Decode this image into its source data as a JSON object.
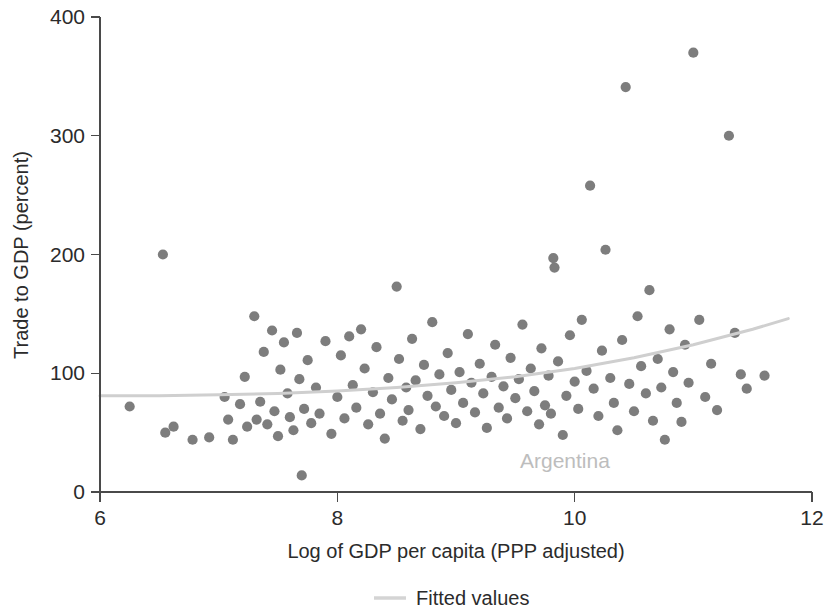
{
  "chart_data": {
    "type": "scatter",
    "title": "",
    "xlabel": "Log of GDP per capita (PPP adjusted)",
    "ylabel": "Trade to GDP (percent)",
    "xlim": [
      6,
      12
    ],
    "ylim": [
      0,
      400
    ],
    "xticks": [
      6,
      8,
      10,
      12
    ],
    "yticks": [
      0,
      100,
      200,
      300,
      400
    ],
    "xtick_labels": [
      "6",
      "8",
      "10",
      "12"
    ],
    "ytick_labels": [
      "0",
      "100",
      "200",
      "300",
      "400"
    ],
    "grid": false,
    "marker_color": "#7d7d7d",
    "fit_color": "#cfcfcf",
    "annotation_color": "#bdbdbd",
    "legend": {
      "position": "below-axis-center",
      "entries": [
        {
          "label": "Fitted values",
          "type": "line",
          "color": "#d4d4d4"
        }
      ]
    },
    "annotations": [
      {
        "text": "Argentina",
        "x": 9.55,
        "y": 28
      }
    ],
    "series": [
      {
        "name": "Countries",
        "type": "scatter",
        "marker": "filled-circle",
        "points": [
          [
            6.25,
            72
          ],
          [
            6.53,
            200
          ],
          [
            6.55,
            50
          ],
          [
            6.62,
            55
          ],
          [
            6.78,
            44
          ],
          [
            6.92,
            46
          ],
          [
            7.05,
            80
          ],
          [
            7.08,
            61
          ],
          [
            7.12,
            44
          ],
          [
            7.18,
            74
          ],
          [
            7.22,
            97
          ],
          [
            7.24,
            55
          ],
          [
            7.3,
            148
          ],
          [
            7.32,
            61
          ],
          [
            7.35,
            76
          ],
          [
            7.38,
            118
          ],
          [
            7.41,
            57
          ],
          [
            7.45,
            136
          ],
          [
            7.47,
            68
          ],
          [
            7.5,
            47
          ],
          [
            7.52,
            103
          ],
          [
            7.55,
            126
          ],
          [
            7.58,
            83
          ],
          [
            7.6,
            63
          ],
          [
            7.63,
            52
          ],
          [
            7.66,
            134
          ],
          [
            7.68,
            95
          ],
          [
            7.7,
            14
          ],
          [
            7.72,
            70
          ],
          [
            7.75,
            111
          ],
          [
            7.78,
            58
          ],
          [
            7.82,
            88
          ],
          [
            7.85,
            66
          ],
          [
            7.9,
            127
          ],
          [
            7.95,
            49
          ],
          [
            8.0,
            80
          ],
          [
            8.03,
            115
          ],
          [
            8.06,
            62
          ],
          [
            8.1,
            131
          ],
          [
            8.13,
            90
          ],
          [
            8.16,
            71
          ],
          [
            8.2,
            137
          ],
          [
            8.23,
            104
          ],
          [
            8.26,
            57
          ],
          [
            8.3,
            84
          ],
          [
            8.33,
            122
          ],
          [
            8.36,
            66
          ],
          [
            8.4,
            45
          ],
          [
            8.43,
            96
          ],
          [
            8.46,
            78
          ],
          [
            8.5,
            173
          ],
          [
            8.52,
            112
          ],
          [
            8.55,
            60
          ],
          [
            8.58,
            88
          ],
          [
            8.6,
            69
          ],
          [
            8.63,
            129
          ],
          [
            8.66,
            94
          ],
          [
            8.7,
            53
          ],
          [
            8.73,
            107
          ],
          [
            8.76,
            81
          ],
          [
            8.8,
            143
          ],
          [
            8.83,
            72
          ],
          [
            8.86,
            99
          ],
          [
            8.9,
            64
          ],
          [
            8.93,
            117
          ],
          [
            8.96,
            86
          ],
          [
            9.0,
            58
          ],
          [
            9.03,
            101
          ],
          [
            9.06,
            75
          ],
          [
            9.1,
            133
          ],
          [
            9.13,
            92
          ],
          [
            9.16,
            67
          ],
          [
            9.2,
            108
          ],
          [
            9.23,
            83
          ],
          [
            9.26,
            54
          ],
          [
            9.3,
            97
          ],
          [
            9.33,
            124
          ],
          [
            9.36,
            71
          ],
          [
            9.4,
            89
          ],
          [
            9.43,
            62
          ],
          [
            9.46,
            113
          ],
          [
            9.5,
            79
          ],
          [
            9.53,
            95
          ],
          [
            9.56,
            141
          ],
          [
            9.6,
            68
          ],
          [
            9.63,
            104
          ],
          [
            9.66,
            85
          ],
          [
            9.7,
            57
          ],
          [
            9.72,
            121
          ],
          [
            9.75,
            73
          ],
          [
            9.78,
            98
          ],
          [
            9.8,
            66
          ],
          [
            9.82,
            197
          ],
          [
            9.83,
            189
          ],
          [
            9.86,
            110
          ],
          [
            9.9,
            48
          ],
          [
            9.93,
            81
          ],
          [
            9.96,
            132
          ],
          [
            10.0,
            93
          ],
          [
            10.03,
            70
          ],
          [
            10.06,
            145
          ],
          [
            10.1,
            102
          ],
          [
            10.13,
            258
          ],
          [
            10.16,
            87
          ],
          [
            10.2,
            64
          ],
          [
            10.23,
            119
          ],
          [
            10.26,
            204
          ],
          [
            10.3,
            96
          ],
          [
            10.33,
            75
          ],
          [
            10.36,
            52
          ],
          [
            10.4,
            128
          ],
          [
            10.43,
            341
          ],
          [
            10.46,
            91
          ],
          [
            10.5,
            68
          ],
          [
            10.53,
            148
          ],
          [
            10.56,
            106
          ],
          [
            10.6,
            83
          ],
          [
            10.63,
            170
          ],
          [
            10.66,
            60
          ],
          [
            10.7,
            112
          ],
          [
            10.73,
            88
          ],
          [
            10.76,
            44
          ],
          [
            10.8,
            137
          ],
          [
            10.83,
            101
          ],
          [
            10.86,
            75
          ],
          [
            10.9,
            59
          ],
          [
            10.93,
            124
          ],
          [
            10.96,
            92
          ],
          [
            11.0,
            370
          ],
          [
            11.05,
            145
          ],
          [
            11.1,
            80
          ],
          [
            11.15,
            108
          ],
          [
            11.2,
            69
          ],
          [
            11.3,
            300
          ],
          [
            11.35,
            134
          ],
          [
            11.4,
            99
          ],
          [
            11.45,
            87
          ],
          [
            11.6,
            98
          ]
        ]
      }
    ],
    "fitted_curve": {
      "name": "Fitted values",
      "x": [
        6.0,
        6.5,
        7.0,
        7.5,
        8.0,
        8.5,
        9.0,
        9.5,
        10.0,
        10.5,
        11.0,
        11.5,
        11.8
      ],
      "y": [
        81,
        81,
        82,
        83,
        85,
        88,
        92,
        97,
        104,
        113,
        124,
        137,
        146
      ]
    }
  }
}
